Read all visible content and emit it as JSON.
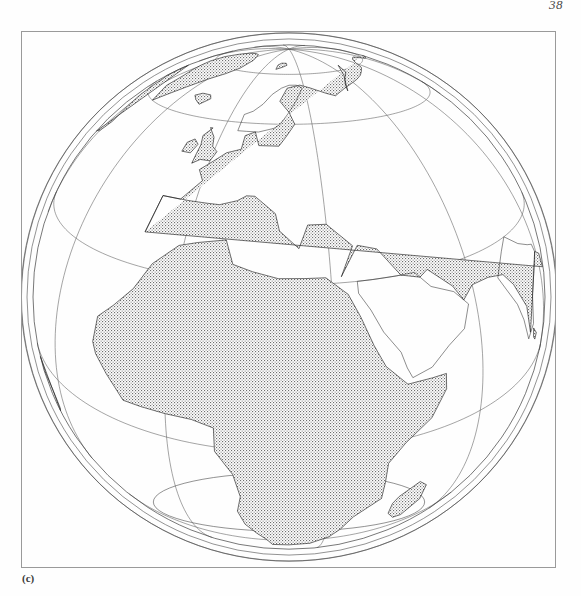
{
  "page": {
    "page_number": "38",
    "figure_label": "(c)",
    "background_color": "#fefefe",
    "frame_color": "#9a9a9a"
  },
  "figure": {
    "type": "map",
    "projection": "tilted perspective azimuthal (globe view)",
    "caption": "(c)",
    "frame": {
      "x": 21,
      "y": 31,
      "width": 535,
      "height": 537
    },
    "line_color": "#5a5a5a",
    "coast_color": "#1c1c1c",
    "land_fill": "stipple"
  },
  "globe": {
    "center_x": 289,
    "center_y": 297,
    "radius": 256,
    "outer_shell_radii": [
      256,
      262,
      268
    ],
    "north_pole": {
      "x": 290,
      "y": 160
    },
    "south_pole": {
      "x": 290,
      "y": 543
    },
    "view_center_lat": 28,
    "view_center_lon": 22,
    "tilt_degrees": 24,
    "camera_distance_radii": 3.2,
    "graticule_spacing_degrees": 30,
    "visible_continents": [
      "Africa",
      "Europe",
      "Asia",
      "North America",
      "South America",
      "Australia",
      "Antarctica",
      "Greenland"
    ]
  },
  "chart_data": {
    "type": "map",
    "title": "",
    "projection": "tilted perspective azimuthal",
    "graticule": {
      "meridian_interval_deg": 30,
      "parallel_interval_deg": 30,
      "meridians": [
        -180,
        -150,
        -120,
        -90,
        -60,
        -30,
        0,
        30,
        60,
        90,
        120,
        150
      ],
      "parallels": [
        -60,
        -30,
        0,
        30,
        60
      ]
    },
    "center": {
      "lat": 28,
      "lon": 22
    },
    "poles_visible": [
      "north",
      "south"
    ],
    "legend": [],
    "annotations": [
      "(c)",
      "38"
    ]
  }
}
